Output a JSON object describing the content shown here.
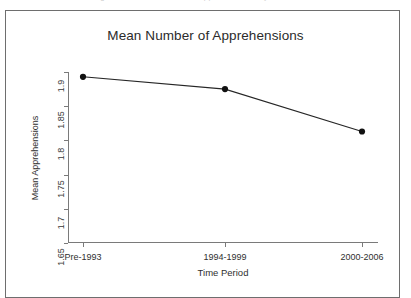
{
  "caption_strip": {
    "text": "Figure 3.  Mean Number of Apprehensions by Time Period"
  },
  "figure": {
    "title": "Mean Number of Apprehensions"
  },
  "chart_data": {
    "type": "line",
    "title": "Mean Number of Apprehensions",
    "xlabel": "Time Period",
    "ylabel": "Mean Apprehensions",
    "categories": [
      "Pre-1993",
      "1994-1999",
      "2000-2006"
    ],
    "values": [
      1.893,
      1.875,
      1.813
    ],
    "ylim": [
      1.65,
      1.9
    ],
    "yticks": [
      "1.65",
      "1.7",
      "1.75",
      "1.8",
      "1.85",
      "1.9"
    ],
    "ytick_values": [
      1.65,
      1.7,
      1.75,
      1.8,
      1.85,
      1.9
    ],
    "grid": false,
    "legend": false,
    "marker": "filled-circle",
    "line_color": "#262626",
    "marker_color": "#111111"
  }
}
